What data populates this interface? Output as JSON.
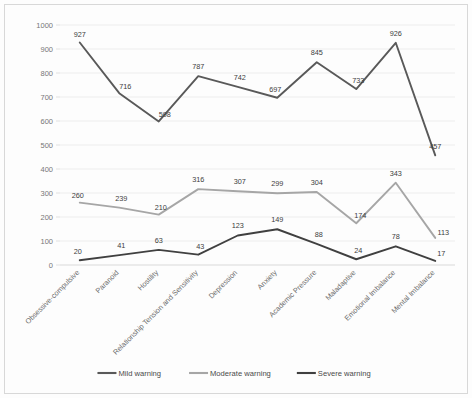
{
  "chart_data": {
    "type": "line",
    "title": "",
    "subtitle": "",
    "xlabel": "",
    "ylabel": "",
    "ylim": [
      0,
      1000
    ],
    "ytick_step": 100,
    "yticks": [
      "0",
      "100",
      "200",
      "300",
      "400",
      "500",
      "600",
      "700",
      "800",
      "900",
      "1000"
    ],
    "grid": true,
    "legend_position": "bottom",
    "categories": [
      "Obsessive-compulsive",
      "Paranoid",
      "Hostility",
      "Relationship Tension and Sensitivity",
      "Depression",
      "Anxiety",
      "Academic Pressure",
      "Maladaptive",
      "Emotional Imbalance",
      "Mental Imbalance"
    ],
    "series": [
      {
        "name": "Mild warning",
        "color": "#595959",
        "values": [
          927,
          716,
          598,
          787,
          742,
          697,
          845,
          733,
          926,
          457
        ]
      },
      {
        "name": "Moderate warning",
        "color": "#a6a6a6",
        "values": [
          260,
          239,
          210,
          316,
          307,
          299,
          304,
          174,
          343,
          113
        ]
      },
      {
        "name": "Severe warning",
        "color": "#404040",
        "values": [
          20,
          41,
          63,
          43,
          123,
          149,
          88,
          24,
          78,
          17
        ]
      }
    ]
  },
  "legend": {
    "items": [
      {
        "label": "Mild warning"
      },
      {
        "label": "Moderate warning"
      },
      {
        "label": "Severe warning"
      }
    ]
  },
  "colors": {
    "gridline": "#e9e9e9",
    "axis": "#d5d5d5",
    "tick_text": "#777777",
    "label_text": "#6d6d6d",
    "datalabel_text": "#3d3d3d",
    "background": "#fdfdfd",
    "frame": "#d8d8d8"
  }
}
